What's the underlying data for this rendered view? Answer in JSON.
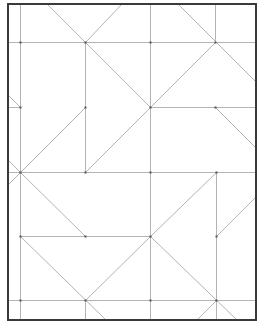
{
  "diagram": {
    "type": "crease-pattern",
    "canvas": {
      "width": 261,
      "height": 333
    },
    "colors": {
      "border": "#3a3a3a",
      "crease": "#b4b4b4",
      "vertex": "#555555",
      "background": "#ffffff"
    },
    "border": {
      "x": 8,
      "y": 4,
      "width": 248,
      "height": 316
    },
    "lines": [
      {
        "id": "v-20",
        "x1": 20,
        "y1": 4,
        "x2": 20,
        "y2": 320
      },
      {
        "id": "v-85-top",
        "x1": 85,
        "y1": 42,
        "x2": 85,
        "y2": 172
      },
      {
        "id": "v-85-bottom",
        "x1": 85,
        "y1": 300,
        "x2": 85,
        "y2": 320
      },
      {
        "id": "v-150",
        "x1": 150,
        "y1": 4,
        "x2": 150,
        "y2": 320
      },
      {
        "id": "v-215-top",
        "x1": 215,
        "y1": 4,
        "x2": 215,
        "y2": 42
      },
      {
        "id": "v-216-bottom",
        "x1": 216,
        "y1": 172,
        "x2": 216,
        "y2": 320
      },
      {
        "id": "h-42",
        "x1": 8,
        "y1": 42,
        "x2": 256,
        "y2": 42
      },
      {
        "id": "h-107-left",
        "x1": 8,
        "y1": 107,
        "x2": 20,
        "y2": 107
      },
      {
        "id": "h-107-right",
        "x1": 150,
        "y1": 107,
        "x2": 256,
        "y2": 107
      },
      {
        "id": "h-172",
        "x1": 8,
        "y1": 172,
        "x2": 256,
        "y2": 172
      },
      {
        "id": "h-236",
        "x1": 20,
        "y1": 236,
        "x2": 150,
        "y2": 236
      },
      {
        "id": "h-300",
        "x1": 8,
        "y1": 300,
        "x2": 256,
        "y2": 300
      },
      {
        "id": "d-a",
        "x1": 47,
        "y1": 4,
        "x2": 150,
        "y2": 107
      },
      {
        "id": "d-b",
        "x1": 121,
        "y1": 4,
        "x2": 85,
        "y2": 42
      },
      {
        "id": "d-c",
        "x1": 178,
        "y1": 4,
        "x2": 256,
        "y2": 82
      },
      {
        "id": "d-d",
        "x1": 215,
        "y1": 42,
        "x2": 150,
        "y2": 107
      },
      {
        "id": "d-e",
        "x1": 150,
        "y1": 107,
        "x2": 85,
        "y2": 172
      },
      {
        "id": "d-f",
        "x1": 85,
        "y1": 107,
        "x2": 20,
        "y2": 172
      },
      {
        "id": "d-g",
        "x1": 8,
        "y1": 95,
        "x2": 20,
        "y2": 107
      },
      {
        "id": "d-h",
        "x1": 215,
        "y1": 107,
        "x2": 256,
        "y2": 148
      },
      {
        "id": "d-i",
        "x1": 8,
        "y1": 160,
        "x2": 20,
        "y2": 172
      },
      {
        "id": "d-j",
        "x1": 8,
        "y1": 184,
        "x2": 20,
        "y2": 172
      },
      {
        "id": "d-k",
        "x1": 20,
        "y1": 172,
        "x2": 85,
        "y2": 236
      },
      {
        "id": "d-l",
        "x1": 216,
        "y1": 172,
        "x2": 150,
        "y2": 236
      },
      {
        "id": "d-m",
        "x1": 216,
        "y1": 236,
        "x2": 256,
        "y2": 196
      },
      {
        "id": "d-n",
        "x1": 20,
        "y1": 236,
        "x2": 106,
        "y2": 320
      },
      {
        "id": "d-o",
        "x1": 150,
        "y1": 236,
        "x2": 85,
        "y2": 300
      },
      {
        "id": "d-p",
        "x1": 150,
        "y1": 236,
        "x2": 237,
        "y2": 320
      },
      {
        "id": "d-q",
        "x1": 216,
        "y1": 300,
        "x2": 196,
        "y2": 320
      }
    ],
    "vertices": [
      {
        "x": 20,
        "y": 42
      },
      {
        "x": 85,
        "y": 42
      },
      {
        "x": 150,
        "y": 42
      },
      {
        "x": 215,
        "y": 42
      },
      {
        "x": 20,
        "y": 107
      },
      {
        "x": 85,
        "y": 107
      },
      {
        "x": 150,
        "y": 107
      },
      {
        "x": 215,
        "y": 107
      },
      {
        "x": 20,
        "y": 172
      },
      {
        "x": 85,
        "y": 172
      },
      {
        "x": 150,
        "y": 172
      },
      {
        "x": 216,
        "y": 172
      },
      {
        "x": 20,
        "y": 236
      },
      {
        "x": 85,
        "y": 236
      },
      {
        "x": 150,
        "y": 236
      },
      {
        "x": 216,
        "y": 236
      },
      {
        "x": 20,
        "y": 300
      },
      {
        "x": 85,
        "y": 300
      },
      {
        "x": 150,
        "y": 300
      },
      {
        "x": 216,
        "y": 300
      }
    ]
  }
}
